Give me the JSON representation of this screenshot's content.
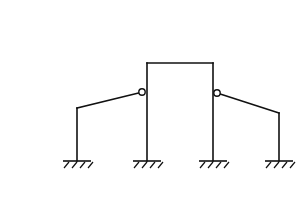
{
  "diagram": {
    "type": "structural-frame",
    "colors": {
      "line": "#111111",
      "background": "#ffffff"
    },
    "portal": {
      "left_x": 147,
      "right_x": 213,
      "top_y": 63,
      "base_y": 161
    },
    "left_wing": {
      "column_x": 77,
      "top_y": 108,
      "hinge": {
        "x": 142,
        "y": 92
      }
    },
    "right_wing": {
      "column_x": 279,
      "top_y": 113,
      "hinge": {
        "x": 217,
        "y": 93
      }
    },
    "hinge_radius": 3.2,
    "supports": [
      {
        "name": "support-1",
        "x": 77,
        "y": 161,
        "half_width": 14
      },
      {
        "name": "support-2",
        "x": 147,
        "y": 161,
        "half_width": 14
      },
      {
        "name": "support-3",
        "x": 213,
        "y": 161,
        "half_width": 14
      },
      {
        "name": "support-4",
        "x": 279,
        "y": 161,
        "half_width": 14
      }
    ]
  }
}
